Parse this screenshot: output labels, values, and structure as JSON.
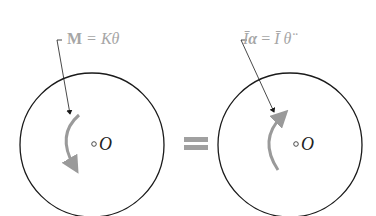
{
  "diagram": {
    "left": {
      "label": "M = Kθ",
      "label_parts": {
        "bold": "M",
        "rest": " = Kθ"
      },
      "center_label": "O",
      "arrow_direction": "clockwise"
    },
    "equals": "=",
    "right": {
      "label": "Īα = Ī θ̈",
      "label_parts": {
        "a": "Ī",
        "b": "α",
        "c": " = ",
        "d": "Ī",
        "e": " θ̈"
      },
      "center_label": "O",
      "arrow_direction": "counterclockwise"
    },
    "colors": {
      "outline": "#1a1a1a",
      "moment_arrow": "#9a9a9a",
      "label": "#a6a6a6",
      "equals": "#a0a0a0"
    }
  }
}
